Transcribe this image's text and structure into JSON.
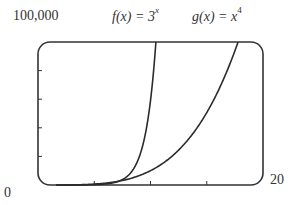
{
  "chart_data": {
    "type": "line",
    "title": "",
    "xlabel": "",
    "ylabel": "",
    "xlim": [
      0,
      20
    ],
    "ylim": [
      0,
      100000
    ],
    "x_tick_labels": {
      "min": "0",
      "max": "20"
    },
    "y_tick_labels": {
      "max": "100,000"
    },
    "x_ticks": [
      5,
      10,
      15
    ],
    "y_ticks": [
      20000,
      40000,
      60000,
      80000
    ],
    "grid": false,
    "legend": "inline labels above plot",
    "series": [
      {
        "name": "f(x) = 3^x",
        "label_func": "f(x) = 3",
        "label_exp": "x",
        "formula": "3^x",
        "x": [
          0,
          2,
          4,
          6,
          7,
          8,
          9,
          10,
          10.48
        ],
        "y": [
          1,
          9,
          81,
          729,
          2187,
          6561,
          19683,
          59049,
          100000
        ]
      },
      {
        "name": "g(x) = x^4",
        "label_func": "g(x) = x",
        "label_exp": "4",
        "formula": "x^4",
        "x": [
          0,
          4,
          6,
          8,
          10,
          12,
          14,
          16,
          17.78
        ],
        "y": [
          0,
          256,
          1296,
          4096,
          10000,
          20736,
          38416,
          65536,
          100000
        ]
      }
    ]
  },
  "labels": {
    "y_max": "100,000",
    "origin": "0",
    "x_max": "20",
    "f_label_text": "f(x) = 3",
    "f_label_exp": "x",
    "g_label_text": "g(x) = x",
    "g_label_exp": "4"
  },
  "colors": {
    "axis": "#333333",
    "curve": "#2b2b2b",
    "background": "#ffffff"
  }
}
